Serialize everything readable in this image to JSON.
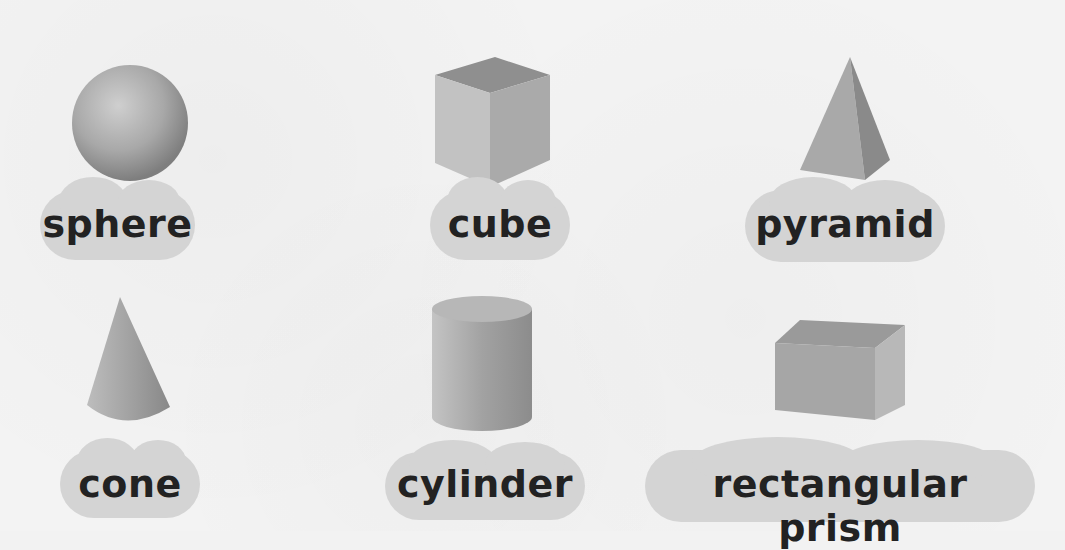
{
  "shapes": [
    {
      "id": "sphere",
      "label": "sphere"
    },
    {
      "id": "cube",
      "label": "cube"
    },
    {
      "id": "pyramid",
      "label": "pyramid"
    },
    {
      "id": "cone",
      "label": "cone"
    },
    {
      "id": "cylinder",
      "label": "cylinder"
    },
    {
      "id": "rectangular-prism",
      "label": "rectangular prism"
    }
  ],
  "colors": {
    "background": "#f2f2f2",
    "label_cloud": "#d4d4d4",
    "label_text": "#222222",
    "shape_light": "#c8c8c8",
    "shape_dark": "#8a8a8a"
  }
}
